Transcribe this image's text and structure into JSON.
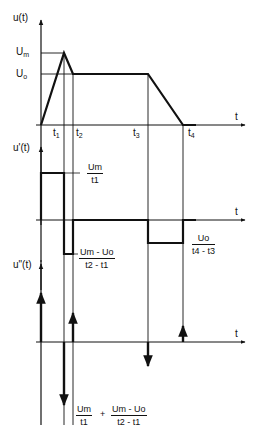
{
  "diagram": {
    "panels": [
      {
        "name": "u(t)",
        "axis_label": "u(t)",
        "x_axis_label": "t",
        "levels": {
          "Um": "U",
          "Um_sub": "m",
          "U0": "U",
          "U0_sub": "o"
        },
        "time_marks": [
          {
            "label": "t",
            "sub": "1"
          },
          {
            "label": "t",
            "sub": "2"
          },
          {
            "label": "t",
            "sub": "3"
          },
          {
            "label": "t",
            "sub": "4"
          }
        ]
      },
      {
        "name": "u'(t)",
        "axis_label": "u'(t)",
        "x_axis_label": "t",
        "annotations": [
          {
            "num": "Um",
            "den": "t1"
          },
          {
            "num": "Um - Uo",
            "den": "t2 - t1"
          },
          {
            "num": "Uo",
            "den": "t4 - t3"
          }
        ]
      },
      {
        "name": "u''(t)",
        "axis_label": "u\"(t)",
        "x_axis_label": "t",
        "annotations": [
          {
            "num1": "Um",
            "den1": "t1",
            "op": "+",
            "num2": "Um - Uo",
            "den2": "t2 - t1"
          }
        ]
      }
    ]
  },
  "labels": {
    "u_axis": "u(t)",
    "du_axis": "u'(t)",
    "ddu_axis": "u\"(t)",
    "t": "t",
    "U": "U",
    "m": "m",
    "o": "o",
    "t1": "1",
    "t2": "2",
    "t3": "3",
    "t4": "4",
    "frac1_num": "Um",
    "frac1_den": "t1",
    "frac2_num": "Um - Uo",
    "frac2_den": "t2 - t1",
    "frac3_num": "Uo",
    "frac3_den": "t4 - t3",
    "frac4_num": "Um",
    "frac4_den": "t1",
    "plus": "+",
    "frac5_num": "Um - Uo",
    "frac5_den": "t2 - t1"
  }
}
